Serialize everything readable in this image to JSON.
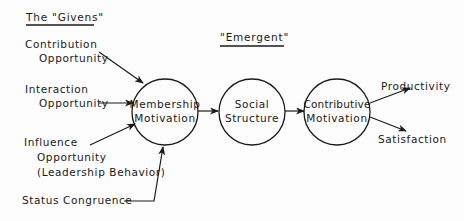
{
  "headings": {
    "givens": "The \"Givens\"",
    "emergent": "\"Emergent\""
  },
  "inputs": [
    {
      "id": "contribution",
      "lines": [
        "Contribution",
        "Opportunity"
      ]
    },
    {
      "id": "interaction",
      "lines": [
        "Interaction",
        "Opportunity"
      ]
    },
    {
      "id": "influence",
      "lines": [
        "Influence",
        "Opportunity",
        "(Leadership Behavior)"
      ]
    },
    {
      "id": "status",
      "lines": [
        "Status Congruence"
      ]
    }
  ],
  "nodes": [
    {
      "id": "membership",
      "lines": [
        "Membership",
        "Motivation"
      ]
    },
    {
      "id": "social",
      "lines": [
        "Social",
        "Structure"
      ]
    },
    {
      "id": "contributive",
      "lines": [
        "Contributive",
        "Motivation"
      ]
    }
  ],
  "outputs": [
    {
      "id": "productivity",
      "label": "Productivity"
    },
    {
      "id": "satisfaction",
      "label": "Satisfaction"
    }
  ],
  "colors": {
    "ink": "#1a1a1a",
    "background": "#fdfdfd"
  }
}
